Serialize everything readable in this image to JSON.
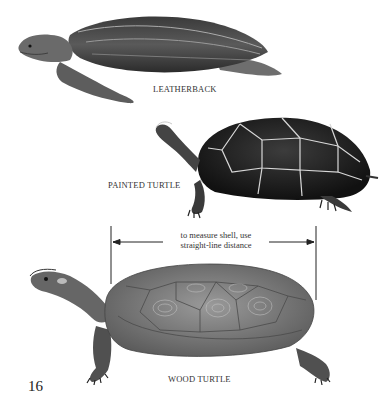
{
  "page": {
    "page_number": "16",
    "background": "#ffffff"
  },
  "illustrations": [
    {
      "name": "leatherback",
      "label": "LEATHERBACK"
    },
    {
      "name": "painted-turtle",
      "label": "PAINTED TURTLE"
    },
    {
      "name": "wood-turtle",
      "label": "WOOD TURTLE"
    }
  ],
  "measurement": {
    "line1": "to measure shell, use",
    "line2": "straight-line distance"
  }
}
